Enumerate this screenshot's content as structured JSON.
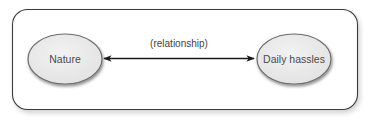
{
  "diagram": {
    "nodes": [
      {
        "id": "nature",
        "label": "Nature",
        "shape": "ellipse"
      },
      {
        "id": "daily-hassles",
        "label": "Daily hassles",
        "shape": "ellipse"
      }
    ],
    "edges": [
      {
        "from": "nature",
        "to": "daily-hassles",
        "label": "(relationship)",
        "direction": "bidirectional"
      }
    ],
    "colors": {
      "frame_stroke": "#3a3a3a",
      "node_fill": "#ebebeb",
      "node_stroke": "#6e6e6e",
      "arrow": "#1a1a1a",
      "text": "#4a4a4a"
    }
  }
}
